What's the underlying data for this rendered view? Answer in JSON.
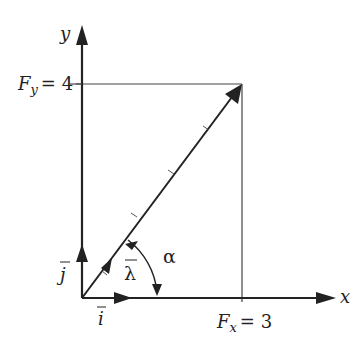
{
  "diagram": {
    "type": "vector-components",
    "colors": {
      "ink": "#222222",
      "background": "#ffffff"
    },
    "axes": {
      "x_label": "x",
      "y_label": "y"
    },
    "force": {
      "Fx_label": "F",
      "Fx_sub": "x",
      "Fx_value": "= 3",
      "Fy_label": "F",
      "Fy_sub": "y",
      "Fy_value": "= 4"
    },
    "unit_vectors": {
      "i_label": "i",
      "j_label": "j",
      "lambda_label": "λ"
    },
    "angle_label": "α"
  }
}
